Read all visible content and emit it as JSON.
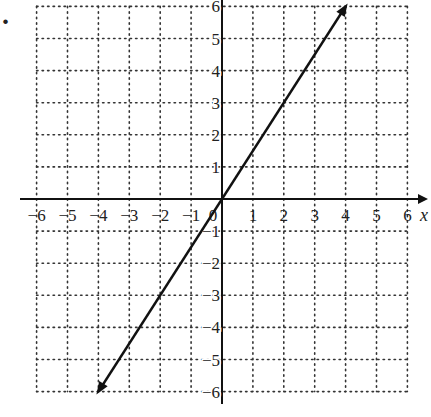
{
  "problem_marker": ".",
  "chart_data": {
    "type": "line",
    "title": "",
    "xlabel": "x",
    "ylabel": "",
    "xlim": [
      -6,
      6
    ],
    "ylim": [
      -6,
      6
    ],
    "grid": true,
    "grid_style": "dotted",
    "x_ticks": [
      -6,
      -5,
      -4,
      -3,
      -2,
      -1,
      0,
      1,
      2,
      3,
      4,
      5,
      6
    ],
    "y_ticks": [
      -6,
      -5,
      -4,
      -3,
      -2,
      -1,
      1,
      2,
      3,
      4,
      5,
      6
    ],
    "x_tick_labels": [
      "−6",
      "−5",
      "−4",
      "−3",
      "−2",
      "−1",
      "0",
      "1",
      "2",
      "3",
      "4",
      "5",
      "6"
    ],
    "y_tick_labels": [
      "−6",
      "−5",
      "−4",
      "−3",
      "−2",
      "−1",
      "1",
      "2",
      "3",
      "4",
      "5",
      "6"
    ],
    "series": [
      {
        "name": "line",
        "equation": "y = 1.5x",
        "x": [
          -4,
          0,
          4
        ],
        "y": [
          -6,
          0,
          6
        ],
        "arrows_both_ends": true,
        "color": "#111111"
      }
    ]
  }
}
